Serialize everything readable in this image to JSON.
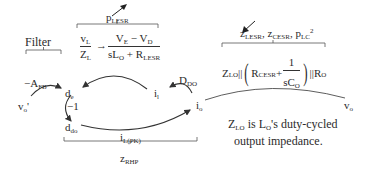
{
  "brackets": {
    "filter": {
      "label": "Filter"
    },
    "inductor": {
      "label_main": "p",
      "label_sub": "LESR"
    },
    "output": {
      "terms": [
        {
          "main": "z",
          "sub": "LESR",
          "suffix": ", "
        },
        {
          "main": "z",
          "sub": "CESR",
          "suffix": ", "
        },
        {
          "main": "p",
          "sub": "LC",
          "sup": "2"
        }
      ]
    },
    "rhp": {
      "label_main": "z",
      "label_sub": "RHP"
    }
  },
  "equations": {
    "inductor_left": {
      "num_main": "v",
      "num_sub": "L",
      "den_main": "Z",
      "den_sub": "L"
    },
    "arrow": "→",
    "inductor_right": {
      "num": {
        "a": "V",
        "a_sub": "E",
        "op": " − ",
        "b": "V",
        "b_sub": "D"
      },
      "den": {
        "a": "sL",
        "a_sub": "O",
        "op": " + ",
        "b": "R",
        "b_sub": "LESR"
      }
    },
    "output_impedance": {
      "z": "Z",
      "z_sub": "LO",
      "par1": " || ",
      "lparen": "(",
      "r": "R",
      "r_sub": "CESR",
      "plus": " + ",
      "frac_num": "1",
      "frac_den": "sC",
      "frac_den_sub": "O",
      "rparen": ")",
      "par2": " || ",
      "ro": "R",
      "ro_sub": "O"
    }
  },
  "nodes": {
    "vo_prime": {
      "main": "v",
      "sub": "o",
      "suffix": "'"
    },
    "de": {
      "main": "d",
      "sub": "e"
    },
    "ddo": {
      "main": "d",
      "sub": "do"
    },
    "il": {
      "main": "i",
      "sub": "l"
    },
    "io": {
      "main": "i",
      "sub": "o"
    },
    "vo": {
      "main": "v",
      "sub": "o"
    }
  },
  "gains": {
    "afb": {
      "main": "−A",
      "sub": "FB"
    },
    "neg_one": "−1",
    "ddo_gain": {
      "main": "D",
      "sub": "DO"
    },
    "ilpk": {
      "main": "i",
      "sub": "L(PK)"
    }
  },
  "note": {
    "line1_a": "Z",
    "line1_sub": "LO",
    "line1_b": " is L",
    "line1_sub2": "O",
    "line1_c": "'s duty-cycled",
    "line2": "output impedance."
  }
}
